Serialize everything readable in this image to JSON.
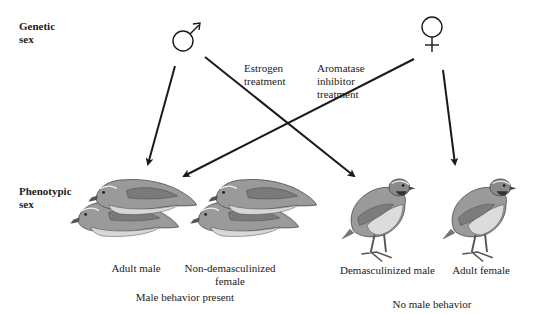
{
  "row_labels": {
    "genetic": [
      "Genetic",
      "sex"
    ],
    "phenotypic": [
      "Phenotypic",
      "sex"
    ]
  },
  "symbols": {
    "male": "male-symbol",
    "female": "female-symbol"
  },
  "treatments": {
    "estrogen": [
      "Estrogen",
      "treatment"
    ],
    "aromatase": [
      "Aromatase",
      "inhibitor",
      "treatment"
    ]
  },
  "phenotypes": [
    {
      "label": [
        "Adult male"
      ],
      "pose": "mounting"
    },
    {
      "label": [
        "Non-demasculinized",
        "female"
      ],
      "pose": "mounting"
    },
    {
      "label": [
        "Demasculinized male"
      ],
      "pose": "standing"
    },
    {
      "label": [
        "Adult female"
      ],
      "pose": "standing"
    }
  ],
  "groups": {
    "left": "Male behavior present",
    "right": "No male behavior"
  },
  "colors": {
    "ink": "#1a1a1a",
    "bird_body": "#9a9a9a",
    "bird_light": "#d8d8d8",
    "bird_dark": "#5a5a5a"
  }
}
